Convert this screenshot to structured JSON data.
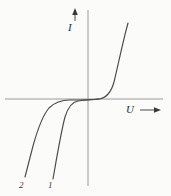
{
  "figure": {
    "kind": "iv-characteristic-diagram",
    "background_color": "#fbfbfa",
    "line_color": "#4a4a4a",
    "axis_color": "#9a9a9a"
  },
  "axes": {
    "vertical": {
      "label": "I",
      "name": "current-axis",
      "x": 88,
      "y_top": 10,
      "y_bottom": 186,
      "arrow_label_marker": {
        "label": "I",
        "x": 75,
        "y_top": 9,
        "y_bottom": 20
      }
    },
    "horizontal": {
      "label": "U",
      "name": "voltage-axis",
      "y": 99,
      "x_left": 5,
      "x_right": 163,
      "arrow_marker": {
        "x_start": 140,
        "x_end": 160,
        "y": 110
      }
    }
  },
  "curves": [
    {
      "id": "1",
      "label": "1",
      "name": "curve-1",
      "description": "diode characteristic 1 — forward conduction rising steeply in first quadrant, reverse breakdown knee nearer the origin",
      "label_position": {
        "x": 48,
        "y": 181
      },
      "path": "M 128 23 C 122 45 118 66 114 82 C 111 93 106 98 99 99 C 92 100 84 100 78 101 C 72 102 68 107 65 117 C 61 132 57 156 53 179"
    },
    {
      "id": "2",
      "label": "2",
      "name": "curve-2",
      "description": "diode characteristic 2 — same forward branch, reverse breakdown occurring at a larger negative voltage (knee further left)",
      "label_position": {
        "x": 19,
        "y": 181
      },
      "path": "M 99 99 C 88 100 78 100 70 100 C 62 100 55 102 49 108 C 43 115 38 128 33 146 C 30 158 27 169 25 177"
    }
  ],
  "chart_data": {
    "type": "line",
    "title": "",
    "xlabel": "U",
    "ylabel": "I",
    "grid": false,
    "legend": "inline-curve-labels",
    "xlim": [
      -1,
      1
    ],
    "ylim": [
      -1,
      1
    ],
    "series": [
      {
        "name": "1",
        "points": [
          [
            0.48,
            0.78
          ],
          [
            0.38,
            0.52
          ],
          [
            0.3,
            0.3
          ],
          [
            0.19,
            0.12
          ],
          [
            0.1,
            0.02
          ],
          [
            0.0,
            0.0
          ],
          [
            -0.1,
            -0.01
          ],
          [
            -0.16,
            -0.03
          ],
          [
            -0.24,
            -0.12
          ],
          [
            -0.3,
            -0.3
          ],
          [
            -0.36,
            -0.55
          ],
          [
            -0.42,
            -0.8
          ]
        ]
      },
      {
        "name": "2",
        "points": [
          [
            0.0,
            0.0
          ],
          [
            -0.12,
            -0.01
          ],
          [
            -0.22,
            -0.01
          ],
          [
            -0.33,
            -0.02
          ],
          [
            -0.45,
            -0.08
          ],
          [
            -0.55,
            -0.2
          ],
          [
            -0.65,
            -0.4
          ],
          [
            -0.72,
            -0.6
          ],
          [
            -0.78,
            -0.78
          ]
        ]
      }
    ]
  }
}
